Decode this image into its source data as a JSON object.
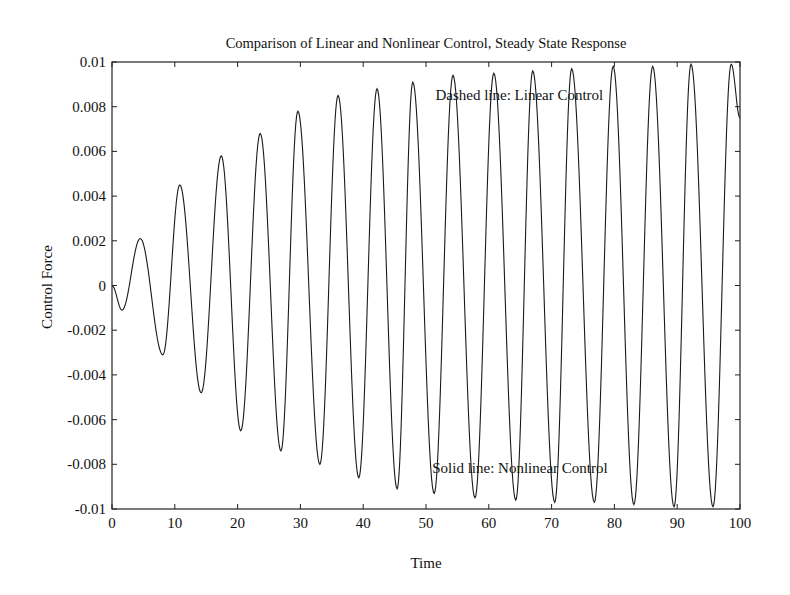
{
  "chart_data": {
    "type": "line",
    "title": "Comparison of Linear and Nonlinear Control, Steady State Response",
    "xlabel": "Time",
    "ylabel": "Control Force",
    "xlim": [
      0,
      100
    ],
    "ylim": [
      -0.01,
      0.01
    ],
    "x_ticks": [
      0,
      10,
      20,
      30,
      40,
      50,
      60,
      70,
      80,
      90,
      100
    ],
    "x_tick_labels": [
      "0",
      "10",
      "20",
      "30",
      "40",
      "50",
      "60",
      "70",
      "80",
      "90",
      "100"
    ],
    "y_ticks": [
      0.01,
      0.008,
      0.006,
      0.004,
      0.002,
      0,
      -0.002,
      -0.004,
      -0.006,
      -0.008,
      -0.01
    ],
    "y_tick_labels": [
      "0.01",
      "0.008",
      "0.006",
      "0.004",
      "0.002",
      "0",
      "-0.002",
      "-0.004",
      "-0.006",
      "-0.008",
      "-0.01"
    ],
    "grid": false,
    "legend": null,
    "annotations": [
      {
        "text": "Dashed line: Linear Control",
        "x": 51.5,
        "y": 0.0083
      },
      {
        "text": "Solid line: Nonlinear Control",
        "x": 51.0,
        "y": -0.0084
      }
    ],
    "series": [
      {
        "name": "Control force response (linear and nonlinear curves overlap)",
        "style": "solid",
        "description": "Oscillation with period ~6.3 and growing amplitude approaching +/-0.01",
        "extrema_x": [
          0,
          1.6,
          4.5,
          8.1,
          10.8,
          14.2,
          17.4,
          20.5,
          23.6,
          26.9,
          29.6,
          33.1,
          36.0,
          39.3,
          42.2,
          45.4,
          47.9,
          51.3,
          54.3,
          57.8,
          60.8,
          64.3,
          67.0,
          70.5,
          73.2,
          76.8,
          79.8,
          83.1,
          86.1,
          89.5,
          92.2,
          95.7,
          98.6,
          100
        ],
        "extrema_y": [
          0,
          -0.0011,
          0.0021,
          -0.0031,
          0.0045,
          -0.0048,
          0.0058,
          -0.0065,
          0.0068,
          -0.0074,
          0.0078,
          -0.008,
          0.0085,
          -0.0086,
          0.0088,
          -0.0091,
          0.0091,
          -0.0093,
          0.0094,
          -0.0095,
          0.0095,
          -0.0096,
          0.0096,
          -0.0097,
          0.0097,
          -0.0097,
          0.0098,
          -0.0098,
          0.0098,
          -0.0099,
          0.0099,
          -0.0099,
          0.0099,
          0.0075
        ]
      }
    ]
  }
}
